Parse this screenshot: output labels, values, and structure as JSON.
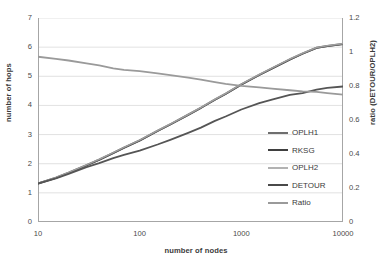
{
  "chart_data": {
    "type": "line",
    "title": "",
    "xlabel": "number of nodes",
    "ylabel": "number of hops",
    "y2label": "ratio (DETOUR/OPLH2)",
    "xscale": "log",
    "xlim": [
      10,
      10000
    ],
    "ylim": [
      0,
      7
    ],
    "y2lim": [
      0,
      1.2
    ],
    "grid": true,
    "legend_position": "center-right",
    "x_ticks": [
      "10",
      "100",
      "1000",
      "10000"
    ],
    "x_tick_values": [
      10,
      100,
      1000,
      10000
    ],
    "y_ticks": [
      "0",
      "1",
      "2",
      "3",
      "4",
      "5",
      "6",
      "7"
    ],
    "y_tick_values": [
      0,
      1,
      2,
      3,
      4,
      5,
      6,
      7
    ],
    "y2_ticks": [
      "0",
      "0.2",
      "0.4",
      "0.6",
      "0.8",
      "1",
      "1.2"
    ],
    "y2_tick_values": [
      0,
      0.2,
      0.4,
      0.6,
      0.8,
      1.0,
      1.2
    ],
    "x": [
      10,
      15,
      20,
      30,
      40,
      55,
      70,
      100,
      150,
      200,
      300,
      400,
      550,
      700,
      1000,
      1500,
      2000,
      3000,
      4000,
      5500,
      7000,
      10000
    ],
    "series": [
      {
        "name": "OPLH1",
        "axis": "left",
        "color": "#6e6e6e",
        "width": 2.0,
        "values": [
          1.32,
          1.52,
          1.69,
          1.95,
          2.14,
          2.37,
          2.55,
          2.8,
          3.13,
          3.35,
          3.68,
          3.92,
          4.2,
          4.4,
          4.72,
          5.05,
          5.27,
          5.58,
          5.78,
          5.98,
          6.04,
          6.11
        ]
      },
      {
        "name": "RKSG",
        "axis": "left",
        "color": "#4d4d4d",
        "width": 1.6,
        "values": [
          1.32,
          1.51,
          1.68,
          1.94,
          2.13,
          2.36,
          2.54,
          2.79,
          3.12,
          3.34,
          3.67,
          3.91,
          4.19,
          4.39,
          4.71,
          5.04,
          5.26,
          5.57,
          5.77,
          5.97,
          6.03,
          6.1
        ]
      },
      {
        "name": "OPLH2",
        "axis": "left",
        "color": "#9e9e9e",
        "width": 1.6,
        "values": [
          1.33,
          1.53,
          1.7,
          1.96,
          2.15,
          2.38,
          2.56,
          2.81,
          3.14,
          3.36,
          3.69,
          3.93,
          4.21,
          4.41,
          4.73,
          5.06,
          5.28,
          5.59,
          5.79,
          5.99,
          6.05,
          6.12
        ]
      },
      {
        "name": "DETOUR",
        "axis": "left",
        "color": "#555555",
        "width": 1.8,
        "values": [
          1.32,
          1.5,
          1.65,
          1.88,
          2.02,
          2.19,
          2.3,
          2.45,
          2.66,
          2.82,
          3.06,
          3.24,
          3.47,
          3.62,
          3.86,
          4.08,
          4.2,
          4.36,
          4.42,
          4.54,
          4.6,
          4.65
        ]
      },
      {
        "name": "Ratio",
        "axis": "right",
        "color": "#9a9a9a",
        "width": 1.8,
        "values_left_equivalent": [
          5.67,
          5.6,
          5.54,
          5.44,
          5.37,
          5.27,
          5.22,
          5.18,
          5.1,
          5.04,
          4.95,
          4.89,
          4.8,
          4.74,
          4.67,
          4.62,
          4.58,
          4.52,
          4.48,
          4.46,
          4.42,
          4.37
        ],
        "values": [
          0.972,
          0.96,
          0.95,
          0.933,
          0.921,
          0.904,
          0.895,
          0.888,
          0.874,
          0.864,
          0.849,
          0.838,
          0.823,
          0.813,
          0.801,
          0.792,
          0.785,
          0.775,
          0.768,
          0.765,
          0.758,
          0.749
        ]
      }
    ]
  },
  "legend": {
    "items": [
      {
        "label": "OPLH1",
        "color": "#6e6e6e"
      },
      {
        "label": "RKSG",
        "color": "#3f3f3f"
      },
      {
        "label": "OPLH2",
        "color": "#b2b2b2"
      },
      {
        "label": "DETOUR",
        "color": "#4a4a4a"
      },
      {
        "label": "Ratio",
        "color": "#9a9a9a"
      }
    ]
  },
  "style": {
    "grid_color": "#d9d9d9",
    "axis_color": "#a6a6a6",
    "text_color": "#3b3b3b",
    "background": "#ffffff"
  }
}
